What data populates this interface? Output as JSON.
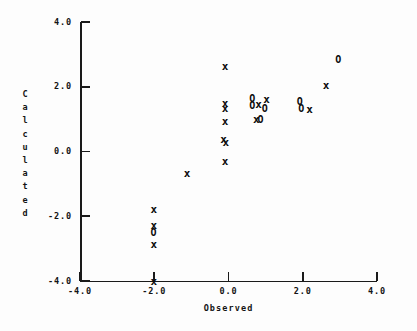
{
  "chart_data": {
    "type": "scatter",
    "title": "",
    "xlabel": "Observed",
    "ylabel": "Calculated",
    "xlim": [
      -4.0,
      4.0
    ],
    "ylim": [
      -4.0,
      4.0
    ],
    "xticks": [
      "-4.0",
      "-2.0",
      "0.0",
      "2.0",
      "4.0"
    ],
    "yticks": [
      "4.0",
      "2.0",
      "0.0",
      "-2.0",
      "-4.0"
    ],
    "xtick_values": [
      -4.0,
      -2.0,
      0.0,
      2.0,
      4.0
    ],
    "ytick_values": [
      4.0,
      2.0,
      0.0,
      -2.0,
      -4.0
    ],
    "grid": false,
    "legend": "none",
    "series": [
      {
        "name": "x-marker",
        "marker": "x",
        "points": [
          {
            "x": -2.02,
            "y": -1.82
          },
          {
            "x": -2.02,
            "y": -2.3
          },
          {
            "x": -2.02,
            "y": -2.88
          },
          {
            "x": -2.02,
            "y": -4.02
          },
          {
            "x": -1.12,
            "y": -0.68
          },
          {
            "x": -0.1,
            "y": 2.62
          },
          {
            "x": -0.1,
            "y": 1.48
          },
          {
            "x": -0.1,
            "y": 1.32
          },
          {
            "x": -0.1,
            "y": 0.92
          },
          {
            "x": -0.14,
            "y": 0.36
          },
          {
            "x": -0.08,
            "y": 0.26
          },
          {
            "x": -0.1,
            "y": -0.32
          },
          {
            "x": 0.8,
            "y": 1.44
          },
          {
            "x": 0.74,
            "y": 0.98
          },
          {
            "x": 1.02,
            "y": 1.58
          },
          {
            "x": 2.18,
            "y": 1.28
          },
          {
            "x": 2.62,
            "y": 2.02
          }
        ]
      },
      {
        "name": "o-marker",
        "marker": "O",
        "points": [
          {
            "x": -2.02,
            "y": -2.52
          },
          {
            "x": 0.64,
            "y": 1.62
          },
          {
            "x": 0.64,
            "y": 1.4
          },
          {
            "x": 0.86,
            "y": 0.98
          },
          {
            "x": 0.98,
            "y": 1.32
          },
          {
            "x": 1.92,
            "y": 1.52
          },
          {
            "x": 1.96,
            "y": 1.32
          },
          {
            "x": 2.96,
            "y": 2.82
          }
        ]
      }
    ]
  },
  "axes": {
    "x_title": "Observed",
    "y_title": "Calculated",
    "y_title_chars": [
      "C",
      "a",
      "l",
      "c",
      "u",
      "l",
      "a",
      "t",
      "e",
      "d"
    ]
  },
  "colors": {
    "axis": "#1a1a1a",
    "marker": "#0d0d0d",
    "background": "#fdfdfd"
  }
}
